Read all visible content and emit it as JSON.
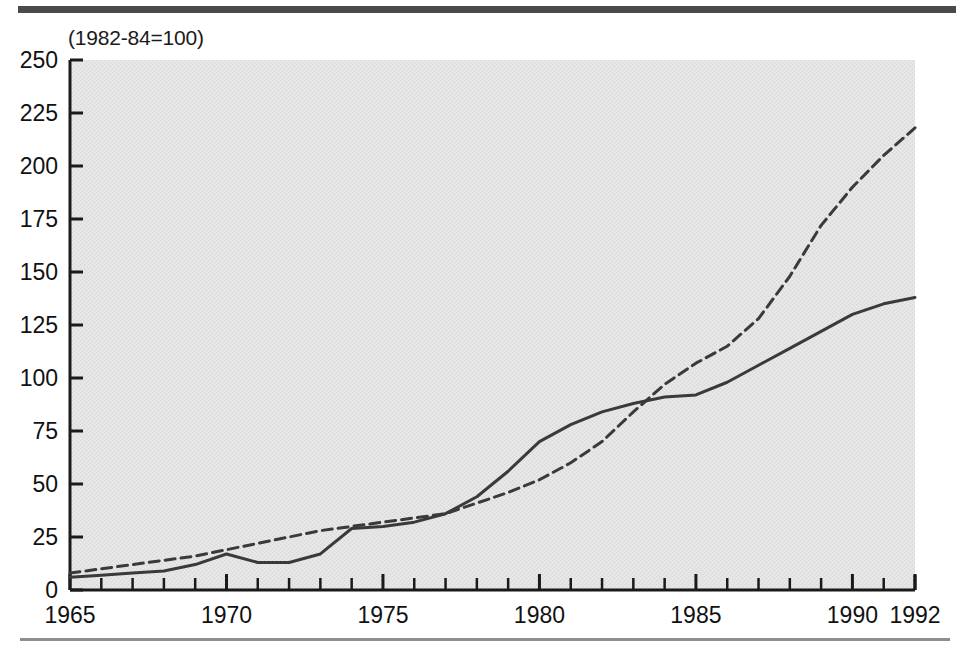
{
  "figure": {
    "note": "(1982-84=100)",
    "background_color": "#ffffff",
    "plot_fill": "#e3e3e3",
    "axis_color": "#1a1a1a",
    "rule_top_color": "#4a4a4a",
    "rule_bottom_color": "#8e8e8e"
  },
  "chart_data": {
    "type": "line",
    "title": "",
    "subtitle": "",
    "annotations": [
      "(1982-84=100)"
    ],
    "xlabel": "",
    "ylabel": "",
    "xlim": [
      1965,
      1992
    ],
    "ylim": [
      0,
      250
    ],
    "yticks": [
      0,
      25,
      50,
      75,
      100,
      125,
      150,
      175,
      200,
      225,
      250
    ],
    "ytick_labels": [
      "0",
      "25",
      "50",
      "75",
      "100",
      "125",
      "150",
      "175",
      "200",
      "225",
      "250"
    ],
    "xticks": [
      1965,
      1970,
      1975,
      1980,
      1985,
      1990,
      1992
    ],
    "xtick_labels": [
      "1965",
      "1970",
      "1975",
      "1980",
      "1985",
      "1990",
      "1992"
    ],
    "x_minor_tick_interval": 1,
    "grid": false,
    "legend": null,
    "legend_position": "none",
    "x": [
      1965,
      1966,
      1967,
      1968,
      1969,
      1970,
      1971,
      1972,
      1973,
      1974,
      1975,
      1976,
      1977,
      1978,
      1979,
      1980,
      1981,
      1982,
      1983,
      1984,
      1985,
      1986,
      1987,
      1988,
      1989,
      1990,
      1991,
      1992
    ],
    "series": [
      {
        "name": "solid-series",
        "style": "solid",
        "color": "#3a3a3a",
        "width": 3,
        "values": [
          6,
          7,
          8,
          9,
          12,
          17,
          13,
          13,
          17,
          29,
          30,
          32,
          36,
          44,
          56,
          70,
          78,
          84,
          88,
          91,
          92,
          98,
          106,
          114,
          122,
          130,
          135,
          138
        ]
      },
      {
        "name": "dashed-series",
        "style": "dashed",
        "color": "#3a3a3a",
        "width": 3,
        "dash_pattern": [
          10,
          6
        ],
        "values": [
          8,
          10,
          12,
          14,
          16,
          19,
          22,
          25,
          28,
          30,
          32,
          34,
          36,
          41,
          46,
          52,
          60,
          70,
          84,
          97,
          107,
          115,
          128,
          148,
          172,
          190,
          205,
          218
        ]
      }
    ]
  }
}
